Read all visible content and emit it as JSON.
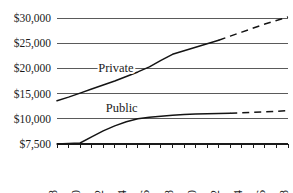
{
  "chart_data": {
    "type": "line",
    "title": "",
    "subtitle": "",
    "xlabel": "",
    "ylabel": "",
    "grid": true,
    "legend_position": "inline-labels",
    "x": [
      1988,
      1989,
      1990,
      1991,
      1992,
      1993,
      1994,
      1995,
      1996,
      1997,
      1998,
      1999,
      2000,
      2001,
      2002,
      2003,
      2004,
      2005,
      2006,
      2007,
      2008
    ],
    "x_tick_labels": [
      "1988",
      "1990",
      "1992",
      "1994",
      "1996",
      "1998",
      "2000",
      "2002",
      "2004",
      "2006",
      "2008"
    ],
    "x_tick_values": [
      1988,
      1990,
      1992,
      1994,
      1996,
      1998,
      2000,
      2002,
      2004,
      2006,
      2008
    ],
    "xlim": [
      1988,
      2008
    ],
    "y_tick_labels": [
      "$7,500",
      "$10,000",
      "$15,000",
      "$20,000",
      "$25,000",
      "$30,000"
    ],
    "y_tick_values": [
      7500,
      10000,
      15000,
      20000,
      25000,
      30000
    ],
    "y_scale_note": "evenly spaced tick positions (non-linear spacing between $7,500 and $10,000)",
    "series": [
      {
        "name": "Private",
        "label": "Private",
        "label_x": 1993.1,
        "label_y": 19300,
        "style": "solid-then-dashed",
        "solid_x": [
          1988,
          1989,
          1990,
          1991,
          1992,
          1993,
          1994,
          1995,
          1996,
          1997,
          1998,
          1999,
          2000,
          2001,
          2002
        ],
        "solid_values": [
          13600,
          14300,
          15100,
          15900,
          16700,
          17500,
          18400,
          19300,
          20300,
          21600,
          22800,
          23500,
          24200,
          24900,
          25600
        ],
        "dashed_x": [
          2002,
          2003,
          2004,
          2005,
          2006,
          2007,
          2008
        ],
        "dashed_values": [
          25600,
          26400,
          27200,
          28000,
          28800,
          29500,
          30200
        ]
      },
      {
        "name": "Public",
        "label": "Public",
        "label_x": 1993.6,
        "label_y": 11400,
        "style": "solid-then-dashed",
        "solid_x": [
          1988,
          1989,
          1990,
          1991,
          1992,
          1993,
          1994,
          1995,
          1996,
          1997,
          1998,
          1999,
          2000,
          2001,
          2002,
          2003
        ],
        "solid_values": [
          7500,
          7550,
          7600,
          8200,
          8800,
          9300,
          9700,
          10000,
          10300,
          10500,
          10700,
          10850,
          10950,
          11000,
          11050,
          11100
        ],
        "dashed_x": [
          2003,
          2004,
          2005,
          2006,
          2007,
          2008
        ],
        "dashed_values": [
          11100,
          11200,
          11300,
          11400,
          11500,
          11600
        ]
      }
    ]
  }
}
